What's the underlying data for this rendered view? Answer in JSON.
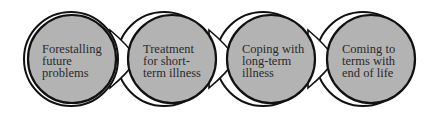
{
  "diagram": {
    "type": "process-flow",
    "colors": {
      "fill": "#b3b3b3",
      "stroke": "#111111",
      "backing": "#ffffff",
      "text": "#2a2a2a",
      "background": "#ffffff"
    },
    "steps": [
      {
        "lines": [
          "Forestalling",
          "future",
          "problems"
        ]
      },
      {
        "lines": [
          "Treatment",
          "for short-",
          "term illness"
        ]
      },
      {
        "lines": [
          "Coping with",
          "long-term",
          "illness"
        ]
      },
      {
        "lines": [
          "Coming to",
          "terms with",
          "end of life"
        ]
      }
    ]
  }
}
